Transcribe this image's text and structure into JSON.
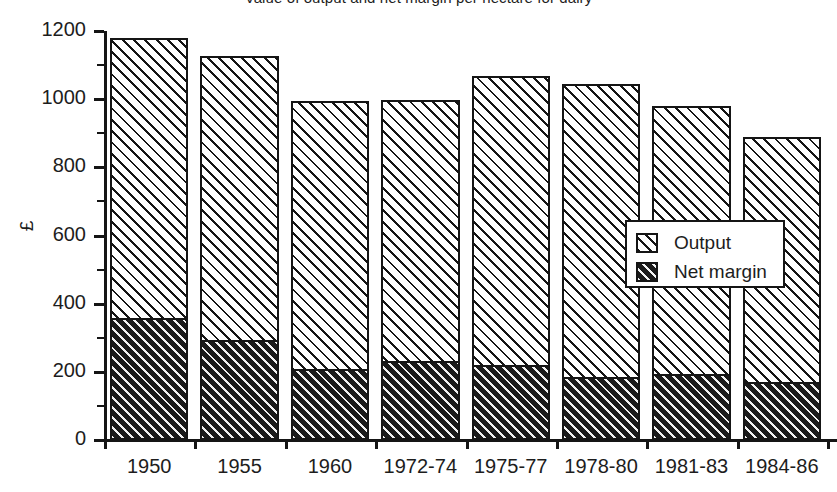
{
  "chart_data": {
    "type": "bar",
    "title": "Value of output and net margin per hectare for dairy",
    "xlabel": "",
    "ylabel": "£",
    "ylim": [
      0,
      1200
    ],
    "y_ticks": [
      0,
      200,
      400,
      600,
      800,
      1000,
      1200
    ],
    "y_minor_ticks": [
      100,
      300,
      500,
      700,
      900,
      1100
    ],
    "grid": false,
    "stacked": false,
    "legend_position": "center-right",
    "categories": [
      "1950",
      "1955",
      "1960",
      "1972-74",
      "1975-77",
      "1978-80",
      "1981-83",
      "1984-86"
    ],
    "series": [
      {
        "name": "Output",
        "values": [
          1180,
          1128,
          994,
          998,
          1068,
          1044,
          980,
          890
        ]
      },
      {
        "name": "Net margin",
        "values": [
          358,
          293,
          208,
          232,
          220,
          185,
          194,
          170
        ]
      }
    ]
  },
  "legend": {
    "items": [
      {
        "label": "Output",
        "style": "light-hatch"
      },
      {
        "label": "Net margin",
        "style": "dark-hatch"
      }
    ]
  },
  "colors": {
    "ink": "#151515",
    "paper": "#ffffff"
  }
}
